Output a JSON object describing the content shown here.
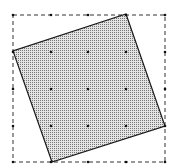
{
  "diagram": {
    "colors": {
      "stroke": "#1a1a1a",
      "shade_bg": "#e6e6e6",
      "shade_dot": "#7a7a7a",
      "dashed": "#333333",
      "point": "#111111"
    },
    "outer_square": {
      "x1": 13,
      "y1": 15,
      "x2": 165,
      "y2": 162,
      "style": "dashed"
    },
    "tilted_square": {
      "vertices": [
        [
          126,
          14
        ],
        [
          165,
          126
        ],
        [
          52,
          162
        ],
        [
          13,
          51
        ]
      ],
      "fill": "stippled"
    },
    "grid_x": [
      13,
      51,
      88,
      126,
      165
    ],
    "grid_y": [
      15,
      52,
      89,
      126,
      162
    ]
  }
}
